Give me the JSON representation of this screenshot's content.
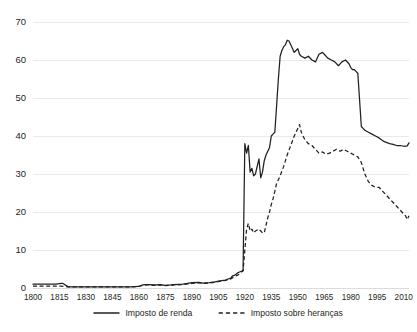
{
  "chart_data": {
    "type": "line",
    "title": "",
    "subtitle": "",
    "xlabel": "",
    "ylabel": "",
    "xlim": [
      1800,
      2013
    ],
    "ylim": [
      0,
      70
    ],
    "grid": true,
    "legend_position": "bottom",
    "y_ticks": [
      "0",
      "10",
      "20",
      "30",
      "40",
      "50",
      "60",
      "70"
    ],
    "y_tick_values": [
      0,
      10,
      20,
      30,
      40,
      50,
      60,
      70
    ],
    "x_ticks": [
      "1800",
      "1815",
      "1830",
      "1845",
      "1860",
      "1875",
      "1890",
      "1905",
      "1920",
      "1935",
      "1950",
      "1965",
      "1980",
      "1995",
      "2010"
    ],
    "x_tick_values": [
      1800,
      1815,
      1830,
      1845,
      1860,
      1875,
      1890,
      1905,
      1920,
      1935,
      1950,
      1965,
      1980,
      1995,
      2010
    ],
    "series": [
      {
        "name": "Imposto de renda",
        "style": "solid",
        "color": "#231f20",
        "x": [
          1800,
          1805,
          1810,
          1813,
          1816,
          1817,
          1820,
          1825,
          1830,
          1835,
          1840,
          1845,
          1850,
          1855,
          1860,
          1862,
          1864,
          1866,
          1868,
          1870,
          1872,
          1875,
          1878,
          1880,
          1885,
          1890,
          1894,
          1896,
          1900,
          1903,
          1906,
          1909,
          1912,
          1913,
          1914,
          1915,
          1916,
          1917,
          1918,
          1919,
          1920,
          1921,
          1922,
          1923,
          1924,
          1925,
          1926,
          1928,
          1929,
          1930,
          1931,
          1932,
          1933,
          1934,
          1935,
          1936,
          1937,
          1938,
          1939,
          1940,
          1941,
          1942,
          1943,
          1944,
          1945,
          1946,
          1947,
          1948,
          1949,
          1950,
          1951,
          1952,
          1954,
          1956,
          1958,
          1960,
          1962,
          1964,
          1965,
          1967,
          1969,
          1971,
          1973,
          1975,
          1977,
          1979,
          1980,
          1981,
          1982,
          1983,
          1984,
          1986,
          1987,
          1988,
          1990,
          1992,
          1994,
          1996,
          1999,
          2002,
          2004,
          2006,
          2008,
          2010,
          2012,
          2013
        ],
        "y": [
          1.0,
          1.0,
          1.0,
          1.0,
          1.2,
          1.2,
          0.3,
          0.3,
          0.3,
          0.3,
          0.3,
          0.3,
          0.3,
          0.3,
          0.4,
          0.8,
          0.9,
          0.9,
          0.8,
          0.8,
          0.9,
          0.7,
          0.8,
          0.9,
          1.0,
          1.4,
          1.5,
          1.3,
          1.4,
          1.6,
          1.9,
          2.1,
          2.6,
          3.2,
          3.3,
          3.6,
          4.0,
          4.2,
          4.4,
          4.6,
          38.0,
          35.5,
          37.5,
          30.5,
          31.5,
          29.5,
          30.0,
          34.0,
          29.0,
          30.5,
          33.5,
          35.0,
          36.0,
          37.0,
          40.0,
          40.5,
          41.0,
          48.0,
          55.0,
          61.0,
          62.5,
          63.5,
          64.0,
          65.2,
          65.0,
          64.0,
          63.0,
          62.0,
          62.5,
          63.0,
          61.5,
          61.0,
          60.5,
          61.0,
          60.0,
          59.5,
          61.5,
          62.0,
          61.5,
          60.5,
          60.0,
          59.5,
          58.5,
          59.5,
          60.0,
          59.0,
          58.0,
          57.5,
          57.5,
          57.0,
          56.5,
          42.5,
          42.0,
          41.5,
          41.0,
          40.5,
          40.0,
          39.5,
          38.5,
          38.0,
          37.8,
          37.5,
          37.5,
          37.3,
          37.4,
          38.2
        ]
      },
      {
        "name": "Imposto sobre heranças",
        "style": "dashed",
        "color": "#231f20",
        "x": [
          1800,
          1805,
          1810,
          1813,
          1816,
          1820,
          1825,
          1830,
          1835,
          1840,
          1845,
          1850,
          1855,
          1860,
          1862,
          1864,
          1866,
          1868,
          1870,
          1872,
          1875,
          1878,
          1880,
          1885,
          1890,
          1894,
          1896,
          1900,
          1903,
          1906,
          1909,
          1912,
          1914,
          1916,
          1917,
          1918,
          1919,
          1920,
          1921,
          1922,
          1923,
          1924,
          1925,
          1926,
          1928,
          1929,
          1930,
          1931,
          1932,
          1933,
          1934,
          1935,
          1936,
          1937,
          1938,
          1940,
          1942,
          1944,
          1946,
          1948,
          1950,
          1951,
          1952,
          1954,
          1956,
          1958,
          1960,
          1962,
          1964,
          1966,
          1968,
          1970,
          1972,
          1974,
          1976,
          1978,
          1980,
          1982,
          1984,
          1986,
          1988,
          1990,
          1992,
          1994,
          1996,
          1998,
          2000,
          2002,
          2004,
          2006,
          2008,
          2010,
          2011,
          2012,
          2013
        ],
        "y": [
          0.5,
          0.5,
          0.5,
          0.5,
          0.5,
          0.3,
          0.3,
          0.3,
          0.3,
          0.3,
          0.3,
          0.3,
          0.3,
          0.4,
          0.7,
          0.8,
          0.8,
          0.7,
          0.7,
          0.8,
          0.6,
          0.7,
          0.8,
          0.9,
          1.2,
          1.4,
          1.2,
          1.3,
          1.5,
          1.8,
          2.0,
          2.4,
          3.0,
          3.4,
          3.8,
          4.2,
          4.5,
          10.0,
          15.5,
          17.0,
          15.0,
          15.5,
          14.5,
          15.0,
          15.5,
          15.0,
          14.5,
          14.5,
          16.5,
          18.5,
          20.0,
          22.0,
          23.5,
          25.5,
          27.5,
          29.5,
          32.0,
          35.0,
          37.5,
          40.0,
          42.0,
          43.0,
          41.0,
          39.0,
          38.0,
          37.5,
          36.5,
          35.5,
          35.8,
          35.2,
          35.5,
          36.0,
          36.5,
          36.0,
          36.5,
          36.0,
          35.5,
          35.0,
          34.5,
          33.0,
          30.0,
          28.0,
          27.0,
          26.5,
          26.5,
          25.5,
          24.5,
          23.5,
          22.5,
          21.5,
          20.5,
          19.5,
          19.0,
          18.0,
          19.0
        ]
      }
    ],
    "legend": [
      {
        "label": "Imposto de renda",
        "style": "solid"
      },
      {
        "label": "Imposto sobre heranças",
        "style": "dashed"
      }
    ]
  }
}
